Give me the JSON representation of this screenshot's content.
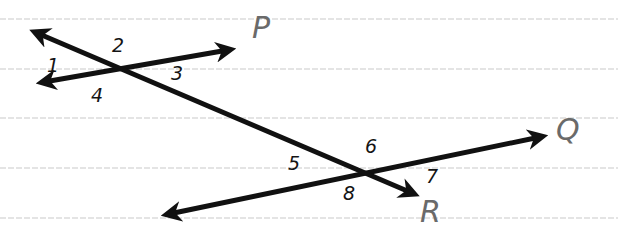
{
  "diagram": {
    "background": "#ffffff",
    "ruled_lines": {
      "color": "#dcdcdc",
      "y_positions": [
        19,
        69,
        118,
        168,
        218
      ]
    },
    "lines": [
      {
        "name": "P",
        "label": "P",
        "label_color": "#6a6a6a",
        "stroke": "#111111",
        "from": [
          44,
          82
        ],
        "to": [
          228,
          50
        ],
        "label_pos": [
          252,
          38
        ]
      },
      {
        "name": "Q",
        "label": "Q",
        "label_color": "#6a6a6a",
        "stroke": "#111111",
        "from": [
          169,
          214
        ],
        "to": [
          540,
          137
        ],
        "label_pos": [
          556,
          140
        ]
      },
      {
        "name": "R",
        "label": "R",
        "label_color": "#6a6a6a",
        "stroke": "#111111",
        "from": [
          37,
          33
        ],
        "to": [
          412,
          193
        ],
        "label_pos": [
          420,
          222
        ]
      }
    ],
    "intersections": [
      {
        "name": "P-R",
        "point": [
          119,
          68
        ]
      },
      {
        "name": "Q-R",
        "point": [
          364,
          171
        ]
      }
    ],
    "angle_labels": [
      {
        "text": "1",
        "pos": [
          47,
          72
        ]
      },
      {
        "text": "2",
        "pos": [
          112,
          52
        ]
      },
      {
        "text": "3",
        "pos": [
          171,
          80
        ]
      },
      {
        "text": "4",
        "pos": [
          91,
          102
        ]
      },
      {
        "text": "5",
        "pos": [
          288,
          170
        ]
      },
      {
        "text": "6",
        "pos": [
          365,
          153
        ]
      },
      {
        "text": "7",
        "pos": [
          426,
          183
        ]
      },
      {
        "text": "8",
        "pos": [
          343,
          200
        ]
      }
    ]
  }
}
